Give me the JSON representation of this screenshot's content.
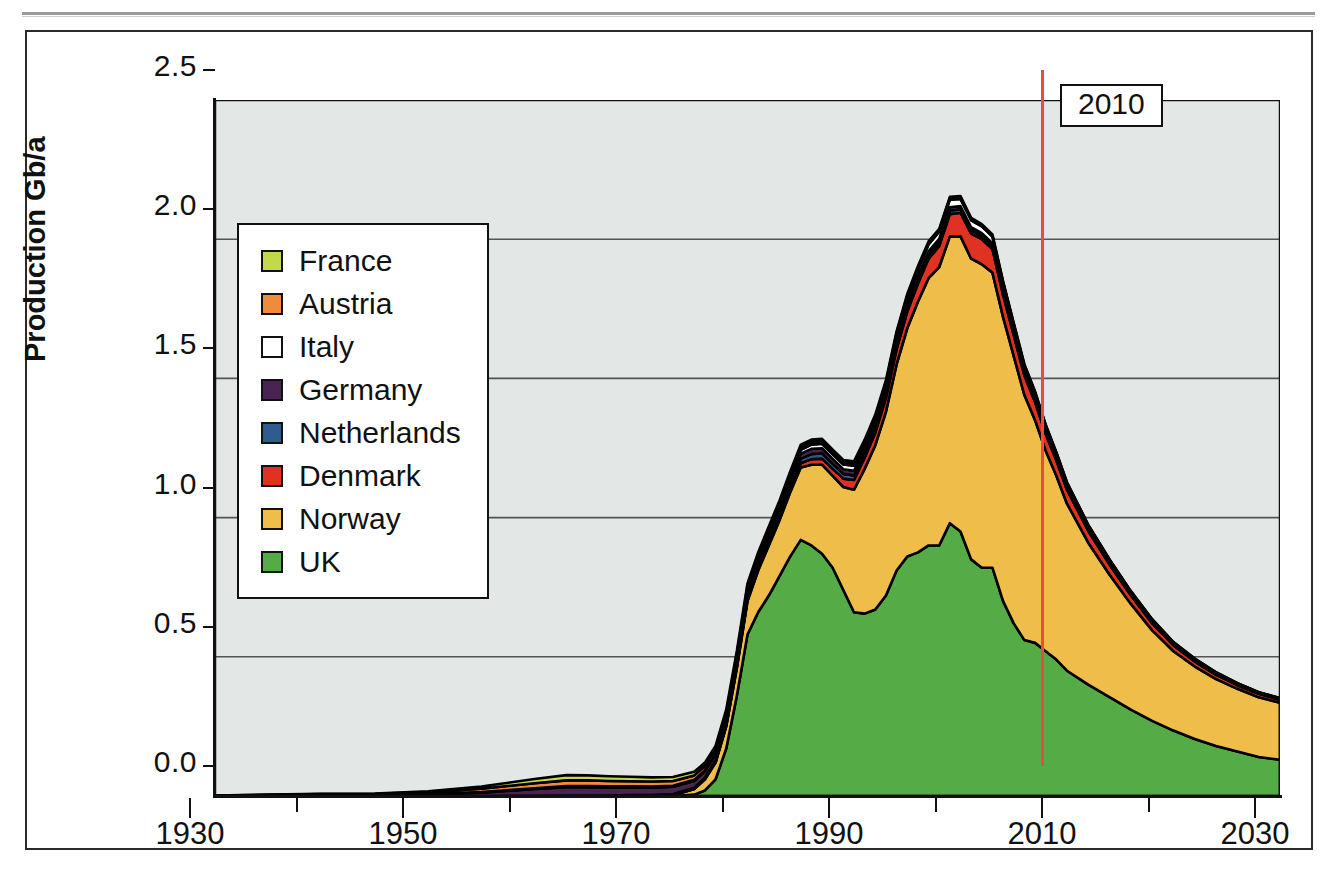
{
  "figure": {
    "y_axis_title": "Production Gb/a",
    "marker_label": "2010"
  },
  "axes": {
    "y_ticks": [
      "0.0",
      "0.5",
      "1.0",
      "1.5",
      "2.0",
      "2.5"
    ],
    "x_ticks": [
      "1930",
      "1950",
      "1970",
      "1990",
      "2010",
      "2030"
    ]
  },
  "legend": {
    "items": [
      {
        "label": "France",
        "color": "#c3d84a"
      },
      {
        "label": "Austria",
        "color": "#f08a3c"
      },
      {
        "label": "Italy",
        "color": "#ffffff"
      },
      {
        "label": "Germany",
        "color": "#4a2352"
      },
      {
        "label": "Netherlands",
        "color": "#2f5c8f"
      },
      {
        "label": "Denmark",
        "color": "#e03123"
      },
      {
        "label": "Norway",
        "color": "#efbd4a"
      },
      {
        "label": "UK",
        "color": "#55ac46"
      }
    ]
  },
  "chart_data": {
    "type": "area",
    "title": "",
    "xlabel": "",
    "ylabel": "Production Gb/a",
    "xlim": [
      1930,
      2030
    ],
    "ylim": [
      0.0,
      2.5
    ],
    "grid": true,
    "stacked": true,
    "legend_position": "inside-left",
    "annotations": [
      {
        "text": "2010",
        "type": "vertical-line-label",
        "x": 2010,
        "color": "#f0483c"
      }
    ],
    "stack_order_bottom_to_top": [
      "UK",
      "Norway",
      "Denmark",
      "Netherlands",
      "Germany",
      "Italy",
      "Austria",
      "France"
    ],
    "x": [
      1930,
      1935,
      1940,
      1945,
      1950,
      1955,
      1960,
      1963,
      1965,
      1967,
      1969,
      1971,
      1973,
      1975,
      1976,
      1977,
      1978,
      1979,
      1980,
      1981,
      1982,
      1983,
      1984,
      1985,
      1986,
      1987,
      1988,
      1989,
      1990,
      1991,
      1992,
      1993,
      1994,
      1995,
      1996,
      1997,
      1998,
      1999,
      2000,
      2001,
      2002,
      2003,
      2004,
      2005,
      2006,
      2007,
      2008,
      2009,
      2010,
      2012,
      2014,
      2016,
      2018,
      2020,
      2022,
      2024,
      2026,
      2028,
      2030
    ],
    "series": [
      {
        "name": "UK",
        "color": "#55ac46",
        "values": [
          0,
          0,
          0,
          0,
          0,
          0,
          0,
          0,
          0,
          0,
          0,
          0,
          0,
          0.005,
          0.02,
          0.06,
          0.17,
          0.36,
          0.58,
          0.66,
          0.72,
          0.79,
          0.86,
          0.92,
          0.9,
          0.87,
          0.82,
          0.74,
          0.66,
          0.655,
          0.67,
          0.72,
          0.81,
          0.86,
          0.875,
          0.9,
          0.9,
          0.98,
          0.95,
          0.85,
          0.82,
          0.82,
          0.7,
          0.62,
          0.56,
          0.55,
          0.52,
          0.49,
          0.45,
          0.4,
          0.355,
          0.31,
          0.27,
          0.235,
          0.205,
          0.18,
          0.16,
          0.14,
          0.13
        ]
      },
      {
        "name": "Norway",
        "color": "#efbd4a",
        "values": [
          0,
          0,
          0,
          0,
          0,
          0,
          0,
          0,
          0,
          0,
          0,
          0,
          0.003,
          0.02,
          0.04,
          0.06,
          0.08,
          0.1,
          0.12,
          0.15,
          0.18,
          0.2,
          0.23,
          0.26,
          0.29,
          0.32,
          0.33,
          0.37,
          0.44,
          0.52,
          0.59,
          0.66,
          0.74,
          0.82,
          0.9,
          0.96,
          1.0,
          1.03,
          1.06,
          1.08,
          1.09,
          1.06,
          1.02,
          0.96,
          0.88,
          0.8,
          0.72,
          0.66,
          0.6,
          0.51,
          0.44,
          0.38,
          0.325,
          0.285,
          0.26,
          0.24,
          0.225,
          0.215,
          0.205
        ]
      },
      {
        "name": "Denmark",
        "color": "#e03123",
        "values": [
          0,
          0,
          0,
          0,
          0,
          0,
          0,
          0,
          0,
          0,
          0,
          0,
          0,
          0,
          0,
          0.001,
          0.002,
          0.003,
          0.005,
          0.006,
          0.008,
          0.01,
          0.012,
          0.015,
          0.02,
          0.022,
          0.025,
          0.03,
          0.035,
          0.04,
          0.045,
          0.05,
          0.055,
          0.06,
          0.065,
          0.07,
          0.075,
          0.08,
          0.085,
          0.09,
          0.09,
          0.085,
          0.08,
          0.075,
          0.07,
          0.065,
          0.06,
          0.055,
          0.05,
          0.042,
          0.036,
          0.03,
          0.025,
          0.021,
          0.018,
          0.015,
          0.013,
          0.012,
          0.011
        ]
      },
      {
        "name": "Netherlands",
        "color": "#2f5c8f",
        "values": [
          0,
          0,
          0,
          0,
          0,
          0,
          0.001,
          0.002,
          0.002,
          0.002,
          0.003,
          0.003,
          0.004,
          0.005,
          0.006,
          0.007,
          0.008,
          0.009,
          0.01,
          0.011,
          0.012,
          0.013,
          0.014,
          0.016,
          0.018,
          0.019,
          0.018,
          0.017,
          0.016,
          0.015,
          0.015,
          0.014,
          0.014,
          0.014,
          0.013,
          0.013,
          0.013,
          0.013,
          0.012,
          0.012,
          0.011,
          0.011,
          0.01,
          0.009,
          0.008,
          0.008,
          0.007,
          0.006,
          0.005,
          0.004,
          0.004,
          0.003,
          0.003,
          0.002,
          0.002,
          0.002,
          0.001,
          0.001,
          0.001
        ]
      },
      {
        "name": "Germany",
        "color": "#4a2352",
        "values": [
          0.001,
          0.002,
          0.004,
          0.004,
          0.006,
          0.012,
          0.024,
          0.03,
          0.03,
          0.029,
          0.028,
          0.027,
          0.026,
          0.024,
          0.023,
          0.022,
          0.021,
          0.021,
          0.02,
          0.02,
          0.019,
          0.019,
          0.019,
          0.019,
          0.019,
          0.018,
          0.018,
          0.017,
          0.017,
          0.016,
          0.016,
          0.015,
          0.015,
          0.014,
          0.014,
          0.013,
          0.013,
          0.012,
          0.012,
          0.011,
          0.011,
          0.01,
          0.01,
          0.009,
          0.008,
          0.008,
          0.007,
          0.006,
          0.005,
          0.004,
          0.004,
          0.003,
          0.003,
          0.002,
          0.002,
          0.002,
          0.001,
          0.001,
          0.001
        ]
      },
      {
        "name": "Italy",
        "color": "#ffffff",
        "values": [
          0,
          0,
          0,
          0,
          0.001,
          0.002,
          0.003,
          0.004,
          0.004,
          0.004,
          0.004,
          0.004,
          0.004,
          0.004,
          0.004,
          0.005,
          0.005,
          0.006,
          0.007,
          0.008,
          0.009,
          0.01,
          0.011,
          0.013,
          0.015,
          0.016,
          0.016,
          0.017,
          0.018,
          0.019,
          0.02,
          0.021,
          0.022,
          0.023,
          0.024,
          0.025,
          0.026,
          0.027,
          0.026,
          0.025,
          0.024,
          0.023,
          0.022,
          0.02,
          0.019,
          0.017,
          0.016,
          0.014,
          0.013,
          0.011,
          0.009,
          0.008,
          0.007,
          0.006,
          0.005,
          0.004,
          0.004,
          0.003,
          0.003
        ]
      },
      {
        "name": "Austria",
        "color": "#f08a3c",
        "values": [
          0.001,
          0.002,
          0.003,
          0.004,
          0.007,
          0.012,
          0.018,
          0.02,
          0.02,
          0.019,
          0.018,
          0.018,
          0.017,
          0.016,
          0.015,
          0.014,
          0.013,
          0.012,
          0.012,
          0.011,
          0.011,
          0.01,
          0.01,
          0.01,
          0.009,
          0.009,
          0.009,
          0.008,
          0.008,
          0.008,
          0.007,
          0.007,
          0.007,
          0.006,
          0.006,
          0.006,
          0.005,
          0.005,
          0.005,
          0.005,
          0.004,
          0.004,
          0.004,
          0.003,
          0.003,
          0.003,
          0.002,
          0.002,
          0.002,
          0.002,
          0.001,
          0.001,
          0.001,
          0.001,
          0.001,
          0.001,
          0.001,
          0.0005,
          0.0005
        ]
      },
      {
        "name": "France",
        "color": "#c3d84a",
        "values": [
          0,
          0.001,
          0.001,
          0.001,
          0.003,
          0.008,
          0.015,
          0.019,
          0.018,
          0.017,
          0.016,
          0.015,
          0.014,
          0.013,
          0.012,
          0.011,
          0.011,
          0.01,
          0.01,
          0.009,
          0.009,
          0.009,
          0.009,
          0.009,
          0.009,
          0.009,
          0.008,
          0.008,
          0.008,
          0.007,
          0.007,
          0.007,
          0.006,
          0.006,
          0.006,
          0.005,
          0.005,
          0.005,
          0.005,
          0.004,
          0.004,
          0.004,
          0.003,
          0.003,
          0.003,
          0.002,
          0.002,
          0.002,
          0.002,
          0.001,
          0.001,
          0.001,
          0.001,
          0.001,
          0.0005,
          0.0005,
          0.0005,
          0.0005,
          0.0005
        ]
      }
    ]
  }
}
